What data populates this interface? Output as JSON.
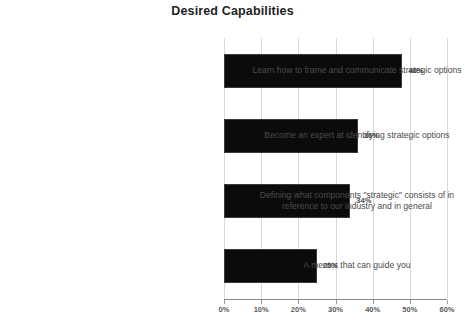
{
  "chart_data": {
    "type": "bar",
    "orientation": "horizontal",
    "title": "Desired Capabilities",
    "xlabel": "",
    "ylabel": "",
    "xlim": [
      0,
      60
    ],
    "grid": "vertical",
    "legend": "none",
    "value_suffix": "%",
    "xticks": [
      "0%",
      "10%",
      "20%",
      "30%",
      "40%",
      "50%",
      "60%"
    ],
    "xtick_values": [
      0,
      10,
      20,
      30,
      40,
      50,
      60
    ],
    "categories": [
      "Learn how to frame and communicate strategic options",
      "Become an expert at identifying strategic options",
      "Defining what components \"strategic\" consists of in reference to our industry and in general",
      "A mentor that can guide you"
    ],
    "values": [
      48,
      36,
      34,
      25
    ],
    "data_labels": [
      "48%",
      "36%",
      "34%",
      "25%"
    ],
    "bar_color": "#0b0b0b",
    "gridline_color": "#d9d9d9",
    "axis_color": "#868686",
    "label_color": "#4b4b4b"
  }
}
